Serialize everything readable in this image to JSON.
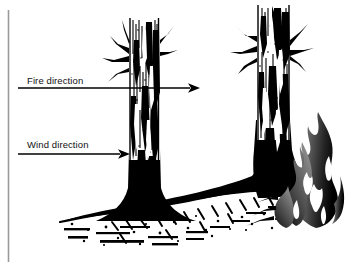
{
  "figure": {
    "type": "line-art-illustration",
    "width": 352,
    "height": 268,
    "background_color": "#ffffff",
    "ink_color": "#000000",
    "frame": {
      "left_rule_color": "#9a9a9a",
      "left_rule_x": 8,
      "left_rule_top": 10,
      "left_rule_bottom": 262
    }
  },
  "annotations": {
    "fire": {
      "label": "Fire direction",
      "label_x": 27,
      "label_y": 75,
      "arrow": {
        "name": "fire-direction-arrow",
        "x1": 18,
        "y1": 88,
        "x2": 198,
        "y2": 88,
        "color": "#000000",
        "head": "solid-triangle"
      }
    },
    "wind": {
      "label": "Wind direction",
      "label_x": 27,
      "label_y": 139,
      "arrow": {
        "name": "wind-direction-arrow",
        "x1": 18,
        "y1": 154,
        "x2": 128,
        "y2": 154,
        "color": "#000000",
        "head": "solid-triangle"
      }
    }
  },
  "scene": {
    "left_tree": {
      "name": "left-charred-trunk",
      "description": "Vertical charred tree trunk with vertical char streaks, flared black base",
      "trunk_left": 128,
      "trunk_right": 160,
      "trunk_top": 18,
      "base_y": 222,
      "char_color": "#000000",
      "highlight_color": "#ffffff"
    },
    "right_tree": {
      "name": "right-charred-trunk",
      "description": "Vertical charred tree trunk with branch stubs, base sweeping right into burnt ground",
      "trunk_left": 255,
      "trunk_right": 290,
      "trunk_top": 5,
      "base_y": 200,
      "char_color": "#000000",
      "highlight_color": "#ffffff"
    },
    "ground": {
      "name": "burnt-ground-litter",
      "description": "Horizontal band of burnt duff and litter with speckled hatch texture",
      "left": 58,
      "right": 330,
      "top": 196,
      "bottom": 250,
      "color": "#000000"
    },
    "flame": {
      "name": "flame-graphic",
      "description": "Stylised flame rising at the right, grey to black gradient with white inner gaps",
      "left": 282,
      "right": 340,
      "top": 112,
      "bottom": 228,
      "gradient_light": "#8c8c8c",
      "gradient_dark": "#0d0d0d"
    }
  }
}
